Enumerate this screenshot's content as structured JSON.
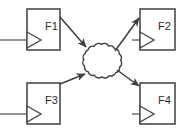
{
  "diagram": {
    "type": "block-flow-network-diagram",
    "canvas": {
      "width": 189,
      "height": 133
    },
    "colors": {
      "background": "#ffffff",
      "stroke": "#4a4a4a",
      "arrow": "#3d3d3d",
      "label": "#2b2b2b"
    },
    "blocks": [
      {
        "id": "F1",
        "label": "F1",
        "symbol": "amplifier-triangle",
        "position": "top-left",
        "rect": {
          "x": 27,
          "y": 9,
          "w": 33,
          "h": 41
        },
        "label_x": 47,
        "label_y": 27,
        "triangle": {
          "x": 27,
          "y": 32,
          "w": 14,
          "h": 16
        },
        "input_line": {
          "x1": 0,
          "y1": 40,
          "x2": 27,
          "y2": 40
        }
      },
      {
        "id": "F2",
        "label": "F2",
        "symbol": "amplifier-triangle",
        "position": "top-right",
        "rect": {
          "x": 140,
          "y": 9,
          "w": 35,
          "h": 41
        },
        "label_x": 161,
        "label_y": 27,
        "triangle": {
          "x": 140,
          "y": 32,
          "w": 14,
          "h": 16
        },
        "input_line": {
          "x1": 132,
          "y1": 40,
          "x2": 140,
          "y2": 40
        }
      },
      {
        "id": "F3",
        "label": "F3",
        "symbol": "amplifier-triangle",
        "position": "bottom-left",
        "rect": {
          "x": 27,
          "y": 83,
          "w": 33,
          "h": 41
        },
        "label_x": 47,
        "label_y": 101,
        "triangle": {
          "x": 27,
          "y": 106,
          "w": 14,
          "h": 16
        },
        "input_line": {
          "x1": 0,
          "y1": 114,
          "x2": 27,
          "y2": 114
        }
      },
      {
        "id": "F4",
        "label": "F4",
        "symbol": "amplifier-triangle",
        "position": "bottom-right",
        "rect": {
          "x": 140,
          "y": 83,
          "w": 35,
          "h": 41
        },
        "label_x": 161,
        "label_y": 101,
        "triangle": {
          "x": 140,
          "y": 106,
          "w": 14,
          "h": 16
        },
        "input_line": {
          "x1": 132,
          "y1": 114,
          "x2": 140,
          "y2": 114
        }
      }
    ],
    "cloud": {
      "name": "network-cloud",
      "center_x": 101,
      "center_y": 62,
      "radius_x": 20,
      "radius_y": 18
    },
    "arrows": [
      {
        "id": "f1-to-cloud",
        "from": "F1",
        "to": "cloud",
        "x1": 60,
        "y1": 17,
        "x2": 87,
        "y2": 48,
        "direction": "down-right"
      },
      {
        "id": "f3-to-cloud",
        "from": "F3",
        "to": "cloud",
        "x1": 60,
        "y1": 83,
        "x2": 86,
        "y2": 74,
        "direction": "up-right"
      },
      {
        "id": "cloud-to-f2",
        "from": "cloud",
        "to": "F2",
        "x1": 116,
        "y1": 50,
        "x2": 140,
        "y2": 17,
        "direction": "up-right"
      },
      {
        "id": "cloud-to-f4",
        "from": "cloud",
        "to": "F4",
        "x1": 117,
        "y1": 70,
        "x2": 140,
        "y2": 86,
        "direction": "down-right"
      }
    ]
  }
}
